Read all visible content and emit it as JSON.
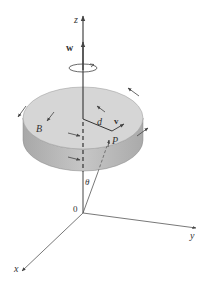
{
  "diagram": {
    "type": "rotating-disk-3d",
    "labels": {
      "z_axis": "z",
      "y_axis": "y",
      "x_axis": "x",
      "origin": "0",
      "angular_velocity": "w",
      "velocity": "v",
      "distance": "d",
      "point": "P",
      "body": "B",
      "angle": "θ"
    },
    "colors": {
      "disk_top": "#d4d4d4",
      "disk_side": "#b8b8b8",
      "lines": "#444444",
      "background": "#ffffff"
    }
  }
}
